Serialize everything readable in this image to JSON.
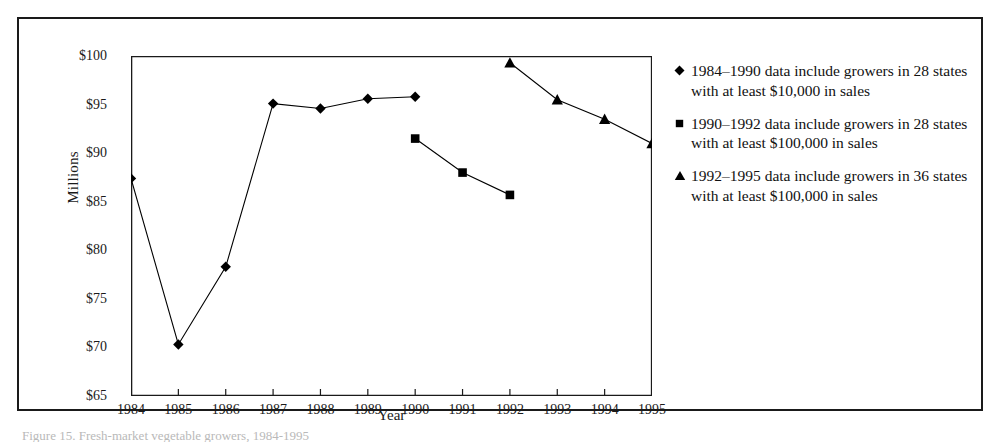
{
  "figure": {
    "caption": "Figure 15. Fresh-market vegetable growers, 1984-1995"
  },
  "chart_data": {
    "type": "line",
    "title": "",
    "xlabel": "Year",
    "ylabel": "Millions",
    "x": [
      1984,
      1985,
      1986,
      1987,
      1988,
      1989,
      1990,
      1991,
      1992,
      1993,
      1994,
      1995
    ],
    "xtick_labels": [
      "1984",
      "1985",
      "1986",
      "1987",
      "1988",
      "1989",
      "1990",
      "1991",
      "1992",
      "1993",
      "1994",
      "1995"
    ],
    "ytick_labels": [
      "$65",
      "$70",
      "$75",
      "$80",
      "$85",
      "$90",
      "$95",
      "$100"
    ],
    "ytick_values": [
      65,
      70,
      75,
      80,
      85,
      90,
      95,
      100
    ],
    "ylim": [
      65,
      100
    ],
    "xlim": [
      1984,
      1995
    ],
    "grid": false,
    "legend_position": "right",
    "series": [
      {
        "name": "1984–1990 data include growers in 28 states with at least $10,000 in sales",
        "marker": "diamond",
        "color": "#000000",
        "x": [
          1984,
          1985,
          1986,
          1987,
          1988,
          1989,
          1990
        ],
        "values": [
          87.4,
          70.3,
          78.3,
          95.1,
          94.6,
          95.6,
          95.8
        ]
      },
      {
        "name": "1990–1992 data include growers in 28 states with at least $100,000 in sales",
        "marker": "square",
        "color": "#000000",
        "x": [
          1990,
          1991,
          1992
        ],
        "values": [
          91.5,
          88.0,
          85.7
        ]
      },
      {
        "name": "1992–1995 data include growers in 36 states with at least $100,000 in sales",
        "marker": "triangle",
        "color": "#000000",
        "x": [
          1992,
          1993,
          1994,
          1995
        ],
        "values": [
          99.3,
          95.5,
          93.5,
          91.0
        ]
      }
    ]
  },
  "legend": {
    "items": [
      {
        "marker": "diamond-marker-icon",
        "label": "1984–1990 data include growers in 28 states with at least $10,000 in sales"
      },
      {
        "marker": "square-marker-icon",
        "label": "1990–1992 data include growers in 28 states with at least $100,000 in sales"
      },
      {
        "marker": "triangle-marker-icon",
        "label": "1992–1995 data include growers in 36 states with at least $100,000 in sales"
      }
    ]
  }
}
